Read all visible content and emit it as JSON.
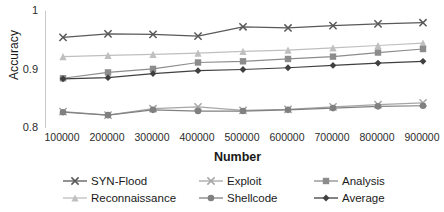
{
  "chart_data": {
    "type": "line",
    "title": "",
    "xlabel": "Number",
    "ylabel": "Accuracy",
    "categories": [
      100000,
      200000,
      300000,
      400000,
      500000,
      600000,
      700000,
      800000,
      900000
    ],
    "x_tick_labels": [
      "100000",
      "200000",
      "300000",
      "400000",
      "500000",
      "600000",
      "700000",
      "800000",
      "900000"
    ],
    "y_tick_labels": [
      "1",
      "0.9",
      "0.8"
    ],
    "ylim": [
      0.8,
      1.0
    ],
    "y_ticks": [
      0.8,
      0.9,
      1.0
    ],
    "grid": false,
    "legend_position": "bottom",
    "series": [
      {
        "name": "SYN-Flood",
        "marker": "x",
        "color": "#595959",
        "values": [
          0.955,
          0.961,
          0.96,
          0.957,
          0.973,
          0.971,
          0.975,
          0.978,
          0.98
        ]
      },
      {
        "name": "Reconnaissance",
        "marker": "triangle",
        "color": "#bfbfbf",
        "values": [
          0.922,
          0.924,
          0.926,
          0.928,
          0.931,
          0.933,
          0.937,
          0.941,
          0.945
        ]
      },
      {
        "name": "Exploit",
        "marker": "x",
        "color": "#a6a6a6",
        "values": [
          0.828,
          0.822,
          0.833,
          0.836,
          0.83,
          0.832,
          0.836,
          0.84,
          0.843
        ]
      },
      {
        "name": "Shellcode",
        "marker": "circle",
        "color": "#808080",
        "values": [
          0.827,
          0.822,
          0.831,
          0.829,
          0.829,
          0.831,
          0.834,
          0.837,
          0.838
        ]
      },
      {
        "name": "Analysis",
        "marker": "square",
        "color": "#8c8c8c",
        "values": [
          0.885,
          0.895,
          0.901,
          0.912,
          0.914,
          0.918,
          0.922,
          0.929,
          0.935
        ]
      },
      {
        "name": "Average",
        "marker": "diamond",
        "color": "#404040",
        "values": [
          0.884,
          0.886,
          0.893,
          0.898,
          0.9,
          0.903,
          0.907,
          0.911,
          0.914
        ]
      }
    ]
  },
  "legend": {
    "items": [
      {
        "label": "SYN-Flood"
      },
      {
        "label": "Exploit"
      },
      {
        "label": "Analysis"
      },
      {
        "label": "Reconnaissance"
      },
      {
        "label": "Shellcode"
      },
      {
        "label": "Average"
      }
    ]
  }
}
